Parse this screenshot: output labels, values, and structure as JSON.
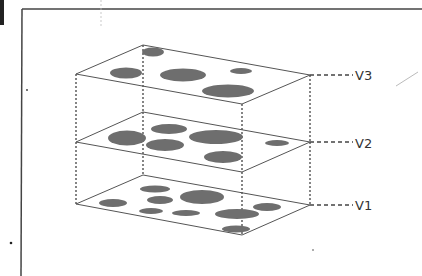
{
  "diagram": {
    "type": "layered-planes",
    "colors": {
      "background": "#ffffff",
      "frame": "#444444",
      "plane_edge": "#555555",
      "blob_fill": "#6e6e6e",
      "connector": "#444444",
      "label": "#333333"
    },
    "layers": [
      {
        "id": "v3",
        "label": "V3",
        "corners": {
          "left": [
            76,
            74
          ],
          "back": [
            143,
            45
          ],
          "right": [
            310,
            75
          ],
          "front": [
            242,
            104
          ]
        },
        "label_pos": [
          355,
          80
        ],
        "blobs": [
          {
            "cx": 153,
            "cy": 52,
            "rx": 11,
            "ry": 4.5
          },
          {
            "cx": 126,
            "cy": 73,
            "rx": 16,
            "ry": 5.5
          },
          {
            "cx": 183,
            "cy": 75,
            "rx": 23,
            "ry": 6.5
          },
          {
            "cx": 241,
            "cy": 71,
            "rx": 11,
            "ry": 3
          },
          {
            "cx": 228,
            "cy": 91,
            "rx": 26,
            "ry": 6.5
          }
        ]
      },
      {
        "id": "v2",
        "label": "V2",
        "corners": {
          "left": [
            76,
            142
          ],
          "back": [
            143,
            112
          ],
          "right": [
            310,
            142
          ],
          "front": [
            242,
            172
          ]
        },
        "label_pos": [
          355,
          148
        ],
        "blobs": [
          {
            "cx": 127,
            "cy": 138,
            "rx": 19,
            "ry": 7.5
          },
          {
            "cx": 169,
            "cy": 129,
            "rx": 18,
            "ry": 5
          },
          {
            "cx": 165,
            "cy": 145,
            "rx": 19,
            "ry": 6
          },
          {
            "cx": 216,
            "cy": 137,
            "rx": 27,
            "ry": 7
          },
          {
            "cx": 223,
            "cy": 157,
            "rx": 19,
            "ry": 6
          },
          {
            "cx": 277,
            "cy": 143,
            "rx": 12,
            "ry": 3
          }
        ]
      },
      {
        "id": "v1",
        "label": "V1",
        "corners": {
          "left": [
            76,
            204
          ],
          "back": [
            143,
            175
          ],
          "right": [
            310,
            205
          ],
          "front": [
            242,
            235
          ]
        },
        "label_pos": [
          355,
          210
        ],
        "blobs": [
          {
            "cx": 155,
            "cy": 189,
            "rx": 15,
            "ry": 3.5
          },
          {
            "cx": 113,
            "cy": 203,
            "rx": 14,
            "ry": 4
          },
          {
            "cx": 160,
            "cy": 200,
            "rx": 13,
            "ry": 4
          },
          {
            "cx": 202,
            "cy": 197,
            "rx": 22,
            "ry": 7
          },
          {
            "cx": 151,
            "cy": 211,
            "rx": 12,
            "ry": 3
          },
          {
            "cx": 186,
            "cy": 213,
            "rx": 14,
            "ry": 3
          },
          {
            "cx": 237,
            "cy": 214,
            "rx": 22,
            "ry": 5
          },
          {
            "cx": 267,
            "cy": 207,
            "rx": 14,
            "ry": 4
          },
          {
            "cx": 236,
            "cy": 229,
            "rx": 14,
            "ry": 3.5
          }
        ]
      }
    ],
    "frame": {
      "top_y": 9,
      "left_x": 22
    }
  }
}
